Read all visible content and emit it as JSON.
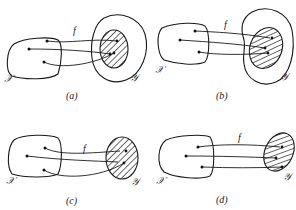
{
  "figure": {
    "panels": [
      {
        "id": "a",
        "caption": "(a)",
        "function_label": "f",
        "domain_label": "𝒳",
        "codomain_label": "𝒴",
        "image_fills_codomain": false
      },
      {
        "id": "b",
        "caption": "(b)",
        "function_label": "f",
        "domain_label": "𝒳",
        "codomain_label": "𝒴",
        "image_fills_codomain": false
      },
      {
        "id": "c",
        "caption": "(c)",
        "function_label": "f",
        "domain_label": "𝒳",
        "codomain_label": "𝒴",
        "image_fills_codomain": true
      },
      {
        "id": "d",
        "caption": "(d)",
        "function_label": "f",
        "domain_label": "𝒳",
        "codomain_label": "𝒴",
        "image_fills_codomain": true
      }
    ]
  },
  "colors": {
    "stroke": "#1a1a1a",
    "background": "#ffffff"
  }
}
